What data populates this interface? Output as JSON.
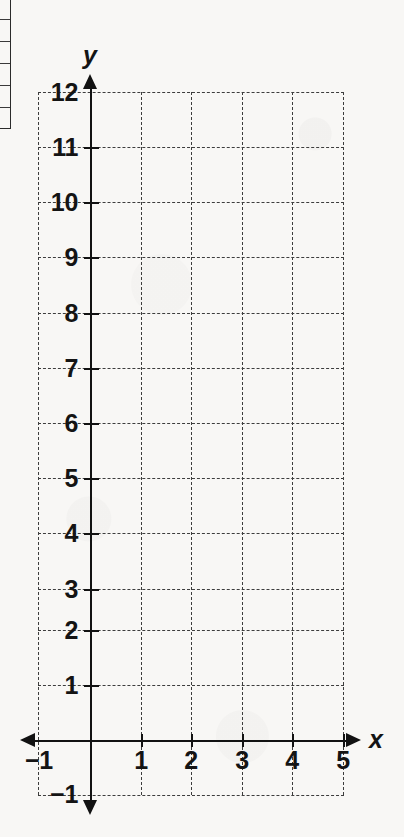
{
  "page": {
    "background_color": "#f8f7f5",
    "ink_color": "#121212",
    "grid_color": "#3d3d3d"
  },
  "table_fragment": {
    "name": "partial-table-left-edge",
    "row_divider_offsets": [
      22,
      44,
      66,
      88,
      110
    ]
  },
  "chart_data": {
    "type": "line",
    "title": "",
    "subtitle": "",
    "xlabel": "x",
    "ylabel": "y",
    "xlim": [
      -1,
      5
    ],
    "ylim": [
      -1,
      12
    ],
    "grid": true,
    "grid_style": "dashed",
    "legend": "none",
    "series": [],
    "x_ticks": [
      -1,
      1,
      2,
      3,
      4,
      5
    ],
    "x_tick_labels": [
      "−1",
      "1",
      "2",
      "3",
      "4",
      "5"
    ],
    "y_ticks": [
      -1,
      1,
      2,
      3,
      4,
      5,
      6,
      7,
      8,
      9,
      10,
      11,
      12
    ],
    "y_tick_labels": [
      "−1",
      "1",
      "2",
      "3",
      "4",
      "5",
      "6",
      "7",
      "8",
      "9",
      "10",
      "11",
      "12"
    ],
    "x_gridlines": [
      -1,
      0,
      1,
      2,
      3,
      4,
      5
    ],
    "y_gridlines": [
      -1,
      1,
      2,
      3,
      4,
      5,
      6,
      7,
      8,
      9,
      10,
      11,
      12
    ],
    "annotations": []
  },
  "axis_names": {
    "y": "y",
    "x": "x"
  },
  "y_labels": [
    {
      "value": 12,
      "text": "12"
    },
    {
      "value": 11,
      "text": "11"
    },
    {
      "value": 10,
      "text": "10"
    },
    {
      "value": 9,
      "text": "9"
    },
    {
      "value": 8,
      "text": "8"
    },
    {
      "value": 7,
      "text": "7"
    },
    {
      "value": 6,
      "text": "6"
    },
    {
      "value": 5,
      "text": "5"
    },
    {
      "value": 4,
      "text": "4"
    },
    {
      "value": 3,
      "text": "3"
    },
    {
      "value": 2,
      "text": "2"
    },
    {
      "value": 1,
      "text": "1"
    },
    {
      "value": -1,
      "text": "−1"
    }
  ],
  "x_labels": [
    {
      "value": -1,
      "text": "−1"
    },
    {
      "value": 1,
      "text": "1"
    },
    {
      "value": 2,
      "text": "2"
    },
    {
      "value": 3,
      "text": "3"
    },
    {
      "value": 4,
      "text": "4"
    },
    {
      "value": 5,
      "text": "5"
    }
  ]
}
